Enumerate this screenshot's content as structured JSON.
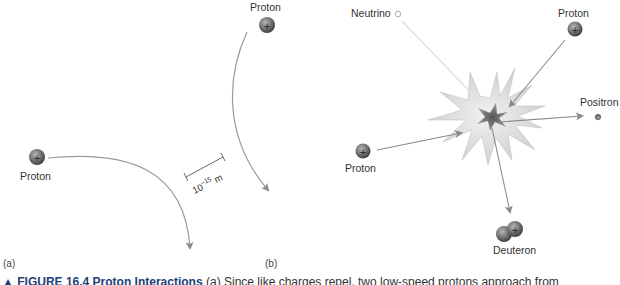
{
  "figure": {
    "panel_a": {
      "label": "(a)",
      "proton_left_label": "Proton",
      "proton_top_label": "Proton",
      "scale_base": "10",
      "scale_exp": "−15",
      "scale_unit": " m"
    },
    "panel_b": {
      "label": "(b)",
      "neutrino_label": "Neutrino",
      "proton_top_label": "Proton",
      "proton_left_label": "Proton",
      "positron_label": "Positron",
      "deuteron_label": "Deuteron"
    },
    "caption": {
      "marker": "▲",
      "number": "FIGURE 16.4",
      "title": "Proton Interactions",
      "text": "(a) Since like charges repel, two low-speed protons approach from"
    },
    "colors": {
      "arrow": "#8a8a8a",
      "proton_fill": "#6e6e6e",
      "burst_fill": "#dcdcdc",
      "caption_accent": "#1d3f7a"
    }
  }
}
